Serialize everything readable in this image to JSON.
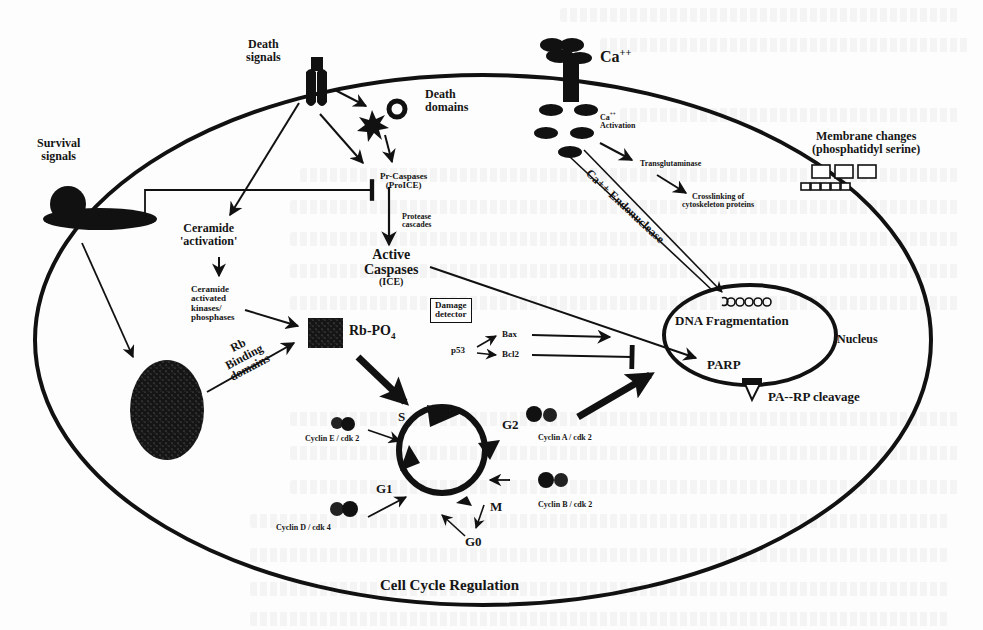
{
  "diagram": {
    "title": "Cell Cycle Regulation",
    "colors": {
      "ink": "#111111",
      "paper": "#fdfdfd",
      "bleed": "#e8e8e8"
    },
    "extracellular": {
      "death_signals": "Death signals",
      "death_signals_line1": "Death",
      "death_signals_line2": "signals",
      "survival_signals_line1": "Survival",
      "survival_signals_line2": "signals",
      "calcium": "Ca",
      "calcium_charge": "++",
      "membrane_changes_line1": "Membrane changes",
      "membrane_changes_line2": "(phosphatidyl serine)"
    },
    "apoptosis_pathway": {
      "death_domains_line1": "Death",
      "death_domains_line2": "domains",
      "pro_caspases_line1": "Pr-Caspases",
      "pro_caspases_line2": "(ProICE)",
      "protease_cascades_line1": "Protease",
      "protease_cascades_line2": "cascades",
      "active_caspases_line1": "Active",
      "active_caspases_line2": "Caspases",
      "active_caspases_line3": "(ICE)",
      "ceramide_activation_line1": "Ceramide",
      "ceramide_activation_line2": "'activation'",
      "ceramide_kinases_line1": "Ceramide",
      "ceramide_kinases_line2": "activated",
      "ceramide_kinases_line3": "kinases/",
      "ceramide_kinases_line4": "phosphases",
      "rb_po4": "Rb-PO",
      "rb_po4_sub": "4",
      "rb_binding_line1": "Rb",
      "rb_binding_line2": "Binding",
      "rb_binding_line3": "domains",
      "damage_detector_line1": "Damage",
      "damage_detector_line2": "detector",
      "p53": "p53",
      "bax": "Bax",
      "bcl2": "Bcl2"
    },
    "calcium_pathway": {
      "ca_activation_charge": "++",
      "ca_activation_line1": "Ca",
      "ca_activation_line2": "Activation",
      "transglutaminase": "Transglutaminase",
      "crosslinking_line1": "Crosslinking of",
      "crosslinking_line2": "cytoskeleton proteins",
      "endonuclease": "Ca++ Endonuclease"
    },
    "nucleus": {
      "label": "Nucleus",
      "dna_fragmentation": "DNA Fragmentation",
      "parp": "PARP",
      "parp_cleavage": "PA--RP cleavage"
    },
    "cell_cycle": {
      "phases": [
        "S",
        "G2",
        "M",
        "G0",
        "G1"
      ],
      "cyclins": [
        {
          "name": "Cyclin E / cdk 2",
          "phase": "S"
        },
        {
          "name": "Cyclin A / cdk 2",
          "phase": "G2"
        },
        {
          "name": "Cyclin B / cdk 2",
          "phase": "M"
        },
        {
          "name": "Cyclin D / cdk 4",
          "phase": "G1"
        }
      ]
    }
  }
}
